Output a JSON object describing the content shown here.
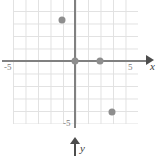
{
  "figure": {
    "kind": "cartesian-coordinate-plane",
    "axis_labels": {
      "x": "x",
      "y": "y"
    },
    "tick_labels": {
      "x_min": "-5",
      "x_max": "5",
      "y_min": "-5"
    },
    "colors": {
      "grid": "#dcdcdc",
      "axis": "#808080",
      "arrow": "#4d4d4d",
      "point": "#8e8e8e",
      "label": "#7a7a7a",
      "background": "#ffffff"
    }
  },
  "chart_data": {
    "type": "scatter",
    "title": "",
    "xlabel": "x",
    "ylabel": "y",
    "xlim": [
      -5,
      5
    ],
    "ylim": [
      -5,
      5
    ],
    "grid": true,
    "grid_step": 1,
    "legend": "none",
    "y_axis_direction": "downward-arrow",
    "xticks": [
      -5,
      5
    ],
    "yticks": [
      -5
    ],
    "xtick_labels": [
      "-5",
      "5"
    ],
    "ytick_labels": [
      "-5"
    ],
    "series": [
      {
        "name": "points",
        "marker": "filled-circle",
        "color": "#8e8e8e",
        "x": [
          -1,
          0,
          2,
          3
        ],
        "y": [
          3,
          0,
          0,
          -4
        ],
        "points": [
          {
            "label": "(-1, 3)",
            "x": -1,
            "y": 3,
            "px": 62,
            "py": 20
          },
          {
            "label": "(0, 0)",
            "x": 0,
            "y": 0,
            "px": 75,
            "py": 61
          },
          {
            "label": "(2, 0)",
            "x": 2,
            "y": 0,
            "px": 100,
            "py": 61
          },
          {
            "label": "(3, -4)",
            "x": 3,
            "y": -4,
            "px": 112,
            "py": 112
          }
        ]
      }
    ]
  }
}
